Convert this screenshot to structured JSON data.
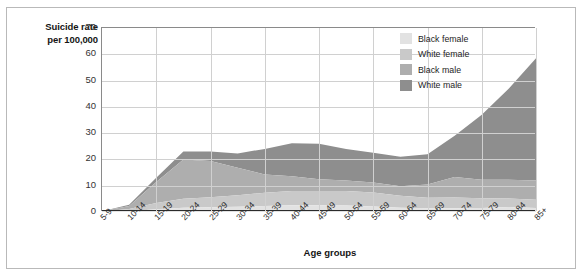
{
  "figure": {
    "y_axis_title": "Suicide rate\nper 100,000",
    "y_axis_title_line1": "Suicide rate",
    "y_axis_title_line2": "per 100,000",
    "x_axis_title": "Age groups"
  },
  "legend": {
    "items": [
      {
        "label": "Black female",
        "color": "#e2e2e2"
      },
      {
        "label": "White female",
        "color": "#c9c9c9"
      },
      {
        "label": "Black male",
        "color": "#aeaeae"
      },
      {
        "label": "White male",
        "color": "#8e8e8e"
      }
    ]
  },
  "chart_data": {
    "type": "area",
    "stacked": true,
    "title": "",
    "xlabel": "Age groups",
    "ylabel": "Suicide rate per 100,000",
    "ylim": [
      0,
      70
    ],
    "yticks": [
      0,
      10,
      20,
      30,
      40,
      50,
      60,
      70
    ],
    "grid": true,
    "legend_position": "top-right-inside",
    "categories": [
      "5-9",
      "10-14",
      "15-19",
      "20-24",
      "25-29",
      "30-34",
      "35-39",
      "40-44",
      "45-49",
      "50-54",
      "55-59",
      "60-64",
      "65-69",
      "70-74",
      "75-79",
      "80-84",
      "85+"
    ],
    "series": [
      {
        "name": "Black female",
        "color": "#e2e2e2",
        "values": [
          0.1,
          0.3,
          1.0,
          1.6,
          1.8,
          2.0,
          2.3,
          2.6,
          2.6,
          2.5,
          2.1,
          1.6,
          1.4,
          1.4,
          1.5,
          1.9,
          1.5
        ]
      },
      {
        "name": "White female",
        "color": "#c9c9c9",
        "values": [
          0.1,
          0.8,
          2.4,
          3.4,
          3.8,
          4.4,
          5.0,
          5.4,
          5.4,
          5.5,
          5.3,
          4.6,
          4.0,
          4.1,
          3.7,
          3.2,
          3.2
        ]
      },
      {
        "name": "Black male",
        "color": "#aeaeae",
        "values": [
          0.1,
          1.2,
          8.0,
          15.0,
          13.8,
          10.4,
          7.0,
          5.6,
          4.5,
          4.0,
          3.8,
          3.6,
          5.1,
          7.8,
          7.1,
          7.2,
          7.3
        ]
      },
      {
        "name": "White male",
        "color": "#8e8e8e",
        "values": [
          0.0,
          0.5,
          1.6,
          3.0,
          3.6,
          5.5,
          9.7,
          12.6,
          13.5,
          12.0,
          11.3,
          11.2,
          11.5,
          15.7,
          24.7,
          34.7,
          46.5
        ]
      }
    ],
    "totals": [
      0.3,
      2.8,
      13.0,
      23.0,
      23.0,
      22.3,
      24.0,
      26.2,
      26.0,
      24.0,
      22.5,
      21.0,
      22.0,
      29.0,
      37.0,
      47.0,
      58.5
    ]
  }
}
